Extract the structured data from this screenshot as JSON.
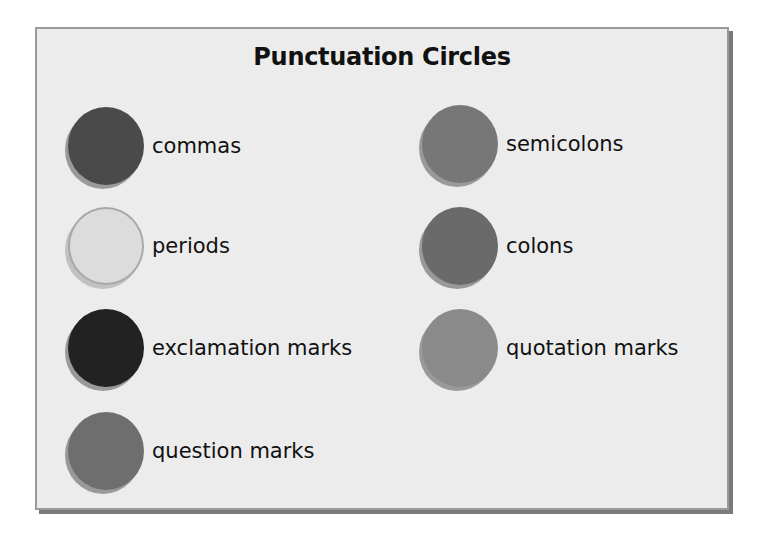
{
  "title": "Punctuation Circles",
  "items": [
    {
      "label": "commas",
      "color": "#4a4a4a"
    },
    {
      "label": "semicolons",
      "color": "#777777"
    },
    {
      "label": "periods",
      "color": "#dcdcdc"
    },
    {
      "label": "colons",
      "color": "#6a6a6a"
    },
    {
      "label": "exclamation marks",
      "color": "#222222"
    },
    {
      "label": "quotation marks",
      "color": "#8a8a8a"
    },
    {
      "label": "question marks",
      "color": "#6e6e6e"
    }
  ]
}
